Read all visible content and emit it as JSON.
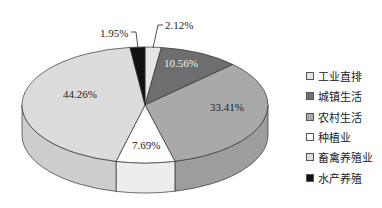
{
  "chart_data": {
    "type": "pie",
    "style": "3d",
    "title": "",
    "categories": [
      "工业直排",
      "城镇生活",
      "农村生活",
      "种植业",
      "畜禽养殖业",
      "水产养殖"
    ],
    "values": [
      2.12,
      10.56,
      33.41,
      7.69,
      44.26,
      1.95
    ],
    "labels": [
      "2.12%",
      "10.56%",
      "33.41%",
      "7.69%",
      "44.26%",
      "1.95%"
    ],
    "colors": [
      "#e6e6e6",
      "#6e6e6e",
      "#a9a9a9",
      "#ffffff",
      "#dcdcdc",
      "#111111"
    ],
    "legend_position": "right"
  },
  "legend": {
    "items": [
      {
        "label": "工业直排",
        "color": "#e6e6e6"
      },
      {
        "label": "城镇生活",
        "color": "#6e6e6e"
      },
      {
        "label": "农村生活",
        "color": "#a9a9a9"
      },
      {
        "label": "种植业",
        "color": "#ffffff"
      },
      {
        "label": "畜禽养殖业",
        "color": "#dcdcdc"
      },
      {
        "label": "水产养殖",
        "color": "#111111"
      }
    ]
  },
  "slice_labels": {
    "industrial": "2.12%",
    "urban": "10.56%",
    "rural": "33.41%",
    "planting": "7.69%",
    "livestock": "44.26%",
    "aquaculture": "1.95%"
  }
}
